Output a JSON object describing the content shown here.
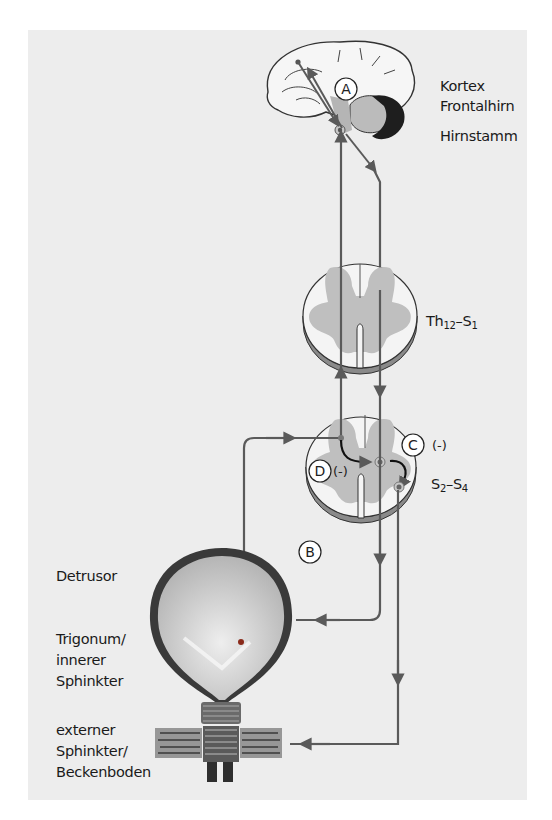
{
  "labels": {
    "kortex": "Kortex",
    "frontalhirn": "Frontalhirn",
    "hirnstamm": "Hirnstamm",
    "th12_s1": {
      "a": "Th",
      "a_sub": "12",
      "dash": "–S",
      "b_sub": "1"
    },
    "s2_s4": {
      "a": "S",
      "a_sub": "2",
      "dash": "–S",
      "b_sub": "4"
    },
    "detrusor": "Detrusor",
    "trigonum": [
      "Trigonum/",
      "innerer",
      "Sphinkter"
    ],
    "externer": [
      "externer",
      "Sphinkter/",
      "Beckenboden"
    ]
  },
  "markers": {
    "A": "A",
    "B": "B",
    "C": "C",
    "C_sign": "(-)",
    "D": "D",
    "D_sign": "(-)"
  },
  "colors": {
    "background": "#ededed",
    "pathway": "#5a5a5a",
    "gray_matter": "#bdbdbd",
    "bladder_wall": "#3a3a3a",
    "bladder_fill": "#c9c9c9"
  }
}
